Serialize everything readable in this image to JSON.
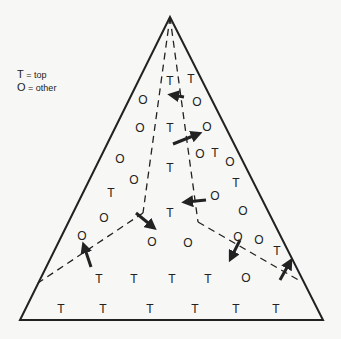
{
  "legend": {
    "items": [
      {
        "key": "T",
        "eq": "=",
        "text": "top"
      },
      {
        "key": "O",
        "eq": "=",
        "text": "other"
      }
    ]
  },
  "colors": {
    "ink": "#222222",
    "background": "#f7f7f5"
  },
  "geometry": {
    "apex": [
      170,
      17
    ],
    "bottom_left": [
      20,
      320
    ],
    "bottom_right": [
      323,
      320
    ],
    "left_junction": [
      143,
      213
    ],
    "right_junction": [
      198,
      222
    ],
    "left_edge_end": [
      38,
      283
    ],
    "right_edge_end": [
      302,
      282
    ]
  },
  "labels": [
    {
      "t": "T",
      "x": 170,
      "y": 81
    },
    {
      "t": "T",
      "x": 191,
      "y": 79
    },
    {
      "t": "O",
      "x": 143,
      "y": 100
    },
    {
      "t": "O",
      "x": 197,
      "y": 102
    },
    {
      "t": "O",
      "x": 140,
      "y": 128
    },
    {
      "t": "T",
      "x": 170,
      "y": 128
    },
    {
      "t": "O",
      "x": 207,
      "y": 127
    },
    {
      "t": "T",
      "x": 170,
      "y": 168
    },
    {
      "t": "O",
      "x": 200,
      "y": 154
    },
    {
      "t": "T",
      "x": 215,
      "y": 153
    },
    {
      "t": "O",
      "x": 230,
      "y": 162
    },
    {
      "t": "O",
      "x": 120,
      "y": 159
    },
    {
      "t": "O",
      "x": 134,
      "y": 180
    },
    {
      "t": "T",
      "x": 111,
      "y": 193
    },
    {
      "t": "T",
      "x": 236,
      "y": 183
    },
    {
      "t": "O",
      "x": 104,
      "y": 218
    },
    {
      "t": "O",
      "x": 215,
      "y": 196
    },
    {
      "t": "O",
      "x": 243,
      "y": 211
    },
    {
      "t": "T",
      "x": 170,
      "y": 213
    },
    {
      "t": "O",
      "x": 82,
      "y": 236
    },
    {
      "t": "O",
      "x": 152,
      "y": 242
    },
    {
      "t": "O",
      "x": 188,
      "y": 243
    },
    {
      "t": "O",
      "x": 238,
      "y": 237
    },
    {
      "t": "O",
      "x": 259,
      "y": 240
    },
    {
      "t": "T",
      "x": 277,
      "y": 251
    },
    {
      "t": "T",
      "x": 99,
      "y": 279
    },
    {
      "t": "T",
      "x": 134,
      "y": 279
    },
    {
      "t": "T",
      "x": 172,
      "y": 279
    },
    {
      "t": "T",
      "x": 208,
      "y": 279
    },
    {
      "t": "O",
      "x": 246,
      "y": 278
    },
    {
      "t": "T",
      "x": 61,
      "y": 309
    },
    {
      "t": "T",
      "x": 103,
      "y": 309
    },
    {
      "t": "T",
      "x": 150,
      "y": 309
    },
    {
      "t": "T",
      "x": 195,
      "y": 309
    },
    {
      "t": "T",
      "x": 236,
      "y": 309
    },
    {
      "t": "T",
      "x": 276,
      "y": 309
    }
  ],
  "arrows": [
    {
      "from": [
        184,
        97
      ],
      "to": [
        172,
        95
      ]
    },
    {
      "from": [
        173,
        144
      ],
      "to": [
        198,
        134
      ]
    },
    {
      "from": [
        206,
        200
      ],
      "to": [
        186,
        202
      ]
    },
    {
      "from": [
        136,
        213
      ],
      "to": [
        153,
        227
      ]
    },
    {
      "from": [
        91,
        267
      ],
      "to": [
        84,
        246
      ]
    },
    {
      "from": [
        240,
        240
      ],
      "to": [
        231,
        258
      ]
    },
    {
      "from": [
        280,
        280
      ],
      "to": [
        290,
        262
      ]
    }
  ]
}
